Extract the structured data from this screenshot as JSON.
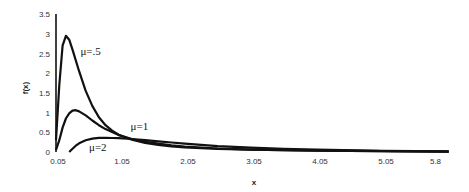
{
  "chart_data": {
    "type": "line",
    "title": "",
    "xlabel": "x",
    "ylabel": "f(x)",
    "xlim": [
      0.05,
      6.05
    ],
    "ylim": [
      0,
      3.5
    ],
    "grid": false,
    "legend": "inline labels",
    "x_ticks": [
      "0.05",
      "1.05",
      "2.05",
      "3.05",
      "4.05",
      "5.05",
      "5.8"
    ],
    "x_tick_values": [
      0.05,
      1.05,
      2.05,
      3.05,
      4.05,
      5.05,
      5.8
    ],
    "y_ticks": [
      "0",
      "0.5",
      "1",
      "1.5",
      "2",
      "2.5",
      "3",
      "3.5"
    ],
    "y_tick_values": [
      0,
      0.5,
      1,
      1.5,
      2,
      2.5,
      3,
      3.5
    ],
    "series": [
      {
        "name": "μ=.5",
        "label_pos": [
          0.42,
          2.45
        ],
        "x": [
          0.05,
          0.1,
          0.15,
          0.2,
          0.25,
          0.3,
          0.4,
          0.5,
          0.6,
          0.7,
          0.8,
          0.9,
          1.0,
          1.2,
          1.4,
          1.6,
          1.8,
          2.0,
          2.5,
          3.0,
          3.5,
          4.0,
          5.0,
          6.0
        ],
        "values": [
          0.3,
          1.7,
          2.7,
          2.95,
          2.85,
          2.6,
          2.05,
          1.55,
          1.17,
          0.88,
          0.68,
          0.54,
          0.44,
          0.31,
          0.23,
          0.18,
          0.14,
          0.12,
          0.08,
          0.06,
          0.045,
          0.035,
          0.02,
          0.01
        ]
      },
      {
        "name": "μ=1",
        "label_pos": [
          1.18,
          0.55
        ],
        "x": [
          0.05,
          0.1,
          0.15,
          0.2,
          0.25,
          0.3,
          0.35,
          0.4,
          0.5,
          0.6,
          0.7,
          0.8,
          1.0,
          1.2,
          1.4,
          1.6,
          1.8,
          2.0,
          2.5,
          3.0,
          3.5,
          4.0,
          5.0,
          6.0
        ],
        "values": [
          0.05,
          0.3,
          0.62,
          0.85,
          0.98,
          1.05,
          1.06,
          1.03,
          0.93,
          0.8,
          0.68,
          0.58,
          0.43,
          0.33,
          0.26,
          0.21,
          0.17,
          0.14,
          0.09,
          0.06,
          0.045,
          0.035,
          0.02,
          0.01
        ]
      },
      {
        "name": "μ=2",
        "label_pos": [
          0.55,
          0.02
        ],
        "x": [
          0.25,
          0.3,
          0.35,
          0.4,
          0.5,
          0.6,
          0.7,
          0.8,
          0.9,
          1.0,
          1.2,
          1.4,
          1.6,
          1.8,
          2.0,
          2.5,
          3.0,
          3.5,
          4.0,
          5.0,
          6.0
        ],
        "values": [
          0.0,
          0.08,
          0.16,
          0.22,
          0.3,
          0.34,
          0.36,
          0.36,
          0.355,
          0.35,
          0.33,
          0.3,
          0.27,
          0.24,
          0.21,
          0.15,
          0.11,
          0.08,
          0.06,
          0.03,
          0.015
        ]
      }
    ]
  }
}
